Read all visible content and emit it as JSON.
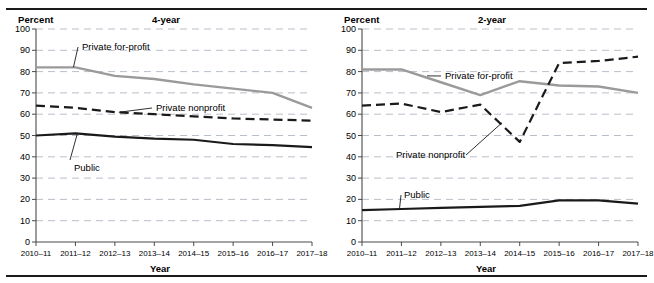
{
  "figure": {
    "background": "#ffffff",
    "rule_color": "#1a1a1a"
  },
  "colors": {
    "public": "#1a1a1a",
    "private_nonprofit": "#1a1a1a",
    "private_for_profit": "#9a9a9a",
    "gridline": "#b9bfc9",
    "axis": "#4a4a4a"
  },
  "panels": [
    {
      "id": "four-year",
      "unit_label": "Percent",
      "title": "4-year",
      "x_caption": "Year",
      "y_ticks": [
        "0",
        "10",
        "20",
        "30",
        "40",
        "50",
        "60",
        "70",
        "80",
        "90",
        "100"
      ],
      "x_ticks": [
        "2010–11",
        "2011–12",
        "2012–13",
        "2013–14",
        "2014–15",
        "2015–16",
        "2016–17",
        "2017–18"
      ],
      "series_labels": [
        {
          "name": "private-for-profit",
          "text": "Private for-profit"
        },
        {
          "name": "private-nonprofit",
          "text": "Private nonprofit"
        },
        {
          "name": "public",
          "text": "Public"
        }
      ]
    },
    {
      "id": "two-year",
      "unit_label": "Percent",
      "title": "2-year",
      "x_caption": "Year",
      "y_ticks": [
        "0",
        "10",
        "20",
        "30",
        "40",
        "50",
        "60",
        "70",
        "80",
        "90",
        "100"
      ],
      "x_ticks": [
        "2010–11",
        "2011–12",
        "2012–13",
        "2013–14",
        "2014–15",
        "2015–16",
        "2016–17",
        "2017–18"
      ],
      "series_labels": [
        {
          "name": "private-for-profit",
          "text": "Private for-profit"
        },
        {
          "name": "private-nonprofit",
          "text": "Private nonprofit"
        },
        {
          "name": "public",
          "text": "Public"
        }
      ]
    }
  ],
  "chart_data": [
    {
      "type": "line",
      "title": "4-year",
      "xlabel": "Year",
      "ylabel": "Percent",
      "ylim": [
        0,
        100
      ],
      "ytick_step": 10,
      "grid": true,
      "legend": "inline-annotations",
      "categories": [
        "2010–11",
        "2011–12",
        "2012–13",
        "2013–14",
        "2014–15",
        "2015–16",
        "2016–17",
        "2017–18"
      ],
      "series": [
        {
          "name": "Private for-profit",
          "style": "solid-gray",
          "color": "#9a9a9a",
          "values": [
            82,
            82,
            78,
            76.5,
            74,
            72,
            70,
            63
          ]
        },
        {
          "name": "Private nonprofit",
          "style": "dashed-black",
          "color": "#1a1a1a",
          "values": [
            64,
            63,
            61,
            60,
            59,
            58,
            57.5,
            57
          ]
        },
        {
          "name": "Public",
          "style": "solid-black",
          "color": "#1a1a1a",
          "values": [
            50,
            51,
            49.5,
            48.5,
            48,
            46,
            45.5,
            44.5
          ]
        }
      ]
    },
    {
      "type": "line",
      "title": "2-year",
      "xlabel": "Year",
      "ylabel": "Percent",
      "ylim": [
        0,
        100
      ],
      "ytick_step": 10,
      "grid": true,
      "legend": "inline-annotations",
      "categories": [
        "2010–11",
        "2011–12",
        "2012–13",
        "2013–14",
        "2014–15",
        "2015–16",
        "2016–17",
        "2017–18"
      ],
      "series": [
        {
          "name": "Private for-profit",
          "style": "solid-gray",
          "color": "#9a9a9a",
          "values": [
            81,
            81,
            75,
            69,
            75.5,
            73.5,
            73,
            70
          ]
        },
        {
          "name": "Private nonprofit",
          "style": "dashed-black",
          "color": "#1a1a1a",
          "values": [
            64,
            65,
            61,
            64.5,
            47,
            84,
            85,
            87
          ]
        },
        {
          "name": "Public",
          "style": "solid-black",
          "color": "#1a1a1a",
          "values": [
            15,
            15.5,
            16,
            16.5,
            17,
            19.5,
            19.5,
            18
          ]
        }
      ]
    }
  ]
}
